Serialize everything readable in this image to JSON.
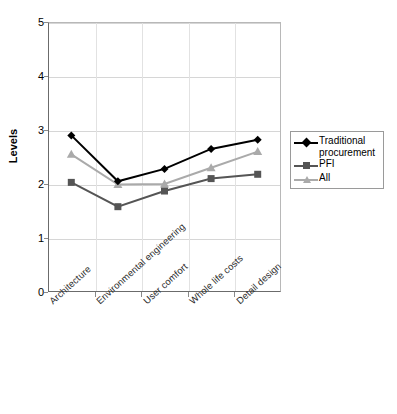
{
  "chart_data": {
    "type": "line",
    "title": "",
    "xlabel": "",
    "ylabel": "Levels",
    "ylim": [
      0,
      5
    ],
    "yticks": [
      0,
      1,
      2,
      3,
      4,
      5
    ],
    "grid": true,
    "legend_position": "right",
    "categories": [
      "Architecture",
      "Environmental engineering",
      "User comfort",
      "Whole life costs",
      "Detail design"
    ],
    "series": [
      {
        "name": "Traditional procurement",
        "color": "#000000",
        "marker": "diamond",
        "values": [
          2.9,
          2.05,
          2.28,
          2.65,
          2.82
        ]
      },
      {
        "name": "PFI",
        "color": "#555555",
        "marker": "square",
        "values": [
          2.03,
          1.58,
          1.87,
          2.1,
          2.18
        ]
      },
      {
        "name": "All",
        "color": "#aaaaaa",
        "marker": "triangle",
        "values": [
          2.55,
          1.99,
          2.0,
          2.3,
          2.6
        ]
      }
    ]
  },
  "axis": {
    "y_title": "Levels",
    "y_tick_labels": [
      "5",
      "4",
      "3",
      "2",
      "1",
      "0"
    ]
  },
  "legend": {
    "entries": [
      {
        "label": "Traditional procurement",
        "color": "#000000",
        "marker": "diamond"
      },
      {
        "label": "PFI",
        "color": "#555555",
        "marker": "square"
      },
      {
        "label": "All",
        "color": "#aaaaaa",
        "marker": "triangle"
      }
    ]
  }
}
